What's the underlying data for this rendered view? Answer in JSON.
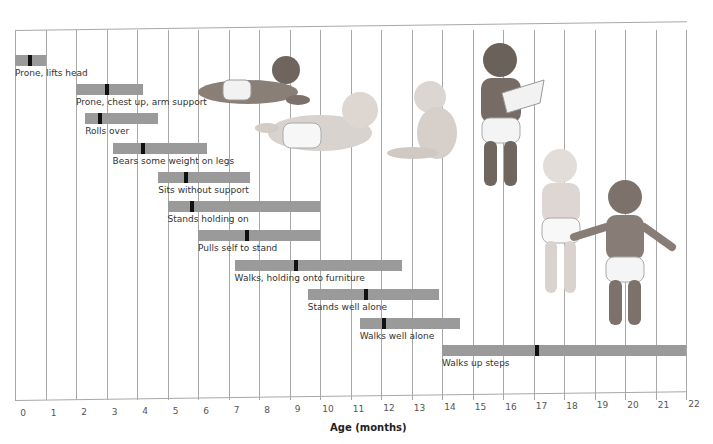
{
  "chart_data": {
    "type": "range-bar",
    "title": "",
    "xlabel": "Age (months)",
    "ylabel": "",
    "xlim": [
      0,
      22
    ],
    "x_ticks": [
      "0",
      "1",
      "2",
      "3",
      "4",
      "5",
      "6",
      "7",
      "8",
      "9",
      "10",
      "11",
      "12",
      "13",
      "14",
      "15",
      "16",
      "17",
      "18",
      "19",
      "20",
      "21",
      "22"
    ],
    "grid": true,
    "legend": null,
    "series": [
      {
        "name": "Prone, lifts head",
        "start": 0.0,
        "end": 1.0,
        "median": 0.5
      },
      {
        "name": "Prone, chest up, arm support",
        "start": 2.0,
        "end": 4.2,
        "median": 3.0
      },
      {
        "name": "Rolls over",
        "start": 2.3,
        "end": 4.7,
        "median": 2.8
      },
      {
        "name": "Bears some weight on legs",
        "start": 3.2,
        "end": 6.3,
        "median": 4.2
      },
      {
        "name": "Sits without support",
        "start": 4.7,
        "end": 7.7,
        "median": 5.6
      },
      {
        "name": "Stands holding on",
        "start": 5.0,
        "end": 10.0,
        "median": 5.8
      },
      {
        "name": "Pulls self to stand",
        "start": 6.0,
        "end": 10.0,
        "median": 7.6
      },
      {
        "name": "Walks, holding onto furniture",
        "start": 7.2,
        "end": 12.7,
        "median": 9.2
      },
      {
        "name": "Stands well alone",
        "start": 9.6,
        "end": 13.9,
        "median": 11.5
      },
      {
        "name": "Walks well alone",
        "start": 11.3,
        "end": 14.6,
        "median": 12.1
      },
      {
        "name": "Walks up steps",
        "start": 14.0,
        "end": 22.0,
        "median": 17.1
      }
    ],
    "colors": {
      "bar": "#9a9a9a",
      "median_marker": "#111111",
      "grid": "#a8a8a8"
    },
    "annotations": [
      "Illustrations of infants at developmental stages: lying prone, reaching/rolling, sitting, standing holding paper, standing, walking"
    ]
  }
}
